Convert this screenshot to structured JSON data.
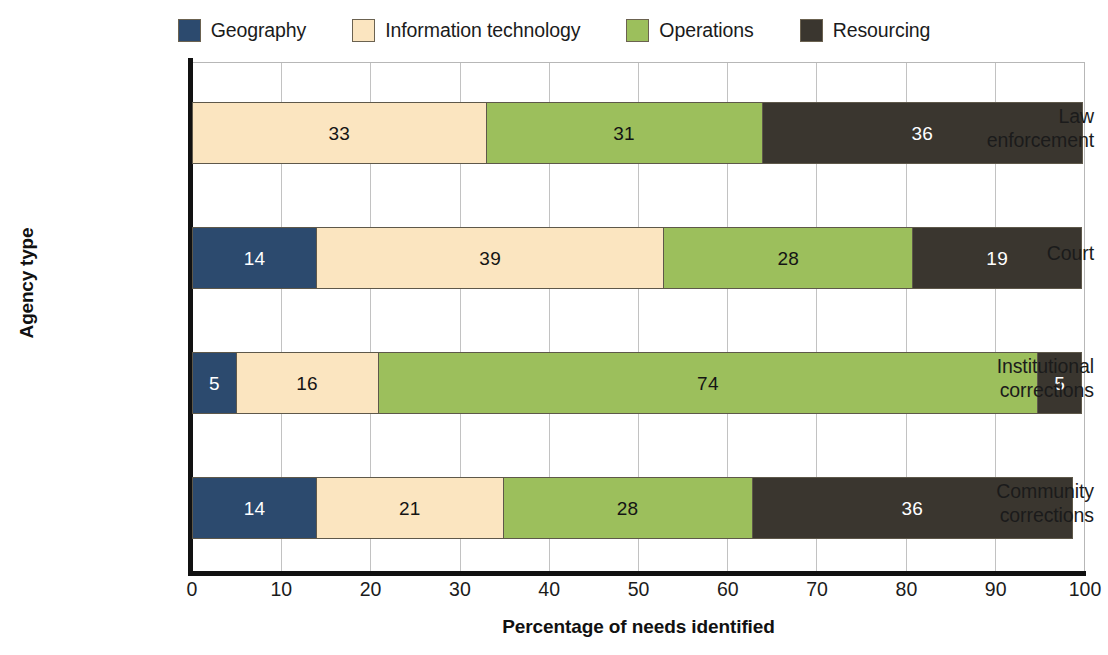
{
  "chart_data": {
    "type": "bar",
    "orientation": "horizontal",
    "stacked": true,
    "title": "",
    "xlabel": "Percentage of needs identified",
    "ylabel": "Agency type",
    "xlim": [
      0,
      100
    ],
    "xticks": [
      0,
      10,
      20,
      30,
      40,
      50,
      60,
      70,
      80,
      90,
      100
    ],
    "grid": "vertical",
    "legend_position": "top",
    "categories": [
      "Law enforcement",
      "Court",
      "Institutional corrections",
      "Community corrections"
    ],
    "category_lines": [
      [
        "Law",
        "enforcement"
      ],
      [
        "Court",
        ""
      ],
      [
        "Institutional",
        "corrections"
      ],
      [
        "Community",
        "corrections"
      ]
    ],
    "series": [
      {
        "name": "Geography",
        "color": "#2c4a6e",
        "values": [
          0,
          14,
          5,
          14
        ]
      },
      {
        "name": "Information technology",
        "color": "#fbe5c0",
        "values": [
          33,
          39,
          16,
          21
        ]
      },
      {
        "name": "Operations",
        "color": "#9cbf5c",
        "values": [
          31,
          28,
          74,
          28
        ]
      },
      {
        "name": "Resourcing",
        "color": "#3a362f",
        "values": [
          36,
          19,
          5,
          36
        ]
      }
    ]
  },
  "legend": {
    "items": [
      {
        "label": "Geography",
        "color": "#2c4a6e"
      },
      {
        "label": "Information technology",
        "color": "#fbe5c0"
      },
      {
        "label": "Operations",
        "color": "#9cbf5c"
      },
      {
        "label": "Resourcing",
        "color": "#3a362f"
      }
    ]
  },
  "axes": {
    "x_title": "Percentage of needs identified",
    "y_title": "Agency type",
    "x_tick_labels": [
      "0",
      "10",
      "20",
      "30",
      "40",
      "50",
      "60",
      "70",
      "80",
      "90",
      "100"
    ]
  },
  "bars": [
    {
      "category": "Law enforcement",
      "line1": "Law",
      "line2": "enforcement",
      "segments": [
        {
          "series": "Information technology",
          "value": 33,
          "label": "33"
        },
        {
          "series": "Operations",
          "value": 31,
          "label": "31"
        },
        {
          "series": "Resourcing",
          "value": 36,
          "label": "36"
        }
      ]
    },
    {
      "category": "Court",
      "line1": "Court",
      "line2": "",
      "segments": [
        {
          "series": "Geography",
          "value": 14,
          "label": "14"
        },
        {
          "series": "Information technology",
          "value": 39,
          "label": "39"
        },
        {
          "series": "Operations",
          "value": 28,
          "label": "28"
        },
        {
          "series": "Resourcing",
          "value": 19,
          "label": "19"
        }
      ]
    },
    {
      "category": "Institutional corrections",
      "line1": "Institutional",
      "line2": "corrections",
      "segments": [
        {
          "series": "Geography",
          "value": 5,
          "label": "5"
        },
        {
          "series": "Information technology",
          "value": 16,
          "label": "16"
        },
        {
          "series": "Operations",
          "value": 74,
          "label": "74"
        },
        {
          "series": "Resourcing",
          "value": 5,
          "label": "5"
        }
      ]
    },
    {
      "category": "Community corrections",
      "line1": "Community",
      "line2": "corrections",
      "segments": [
        {
          "series": "Geography",
          "value": 14,
          "label": "14"
        },
        {
          "series": "Information technology",
          "value": 21,
          "label": "21"
        },
        {
          "series": "Operations",
          "value": 28,
          "label": "28"
        },
        {
          "series": "Resourcing",
          "value": 36,
          "label": "36"
        }
      ]
    }
  ]
}
